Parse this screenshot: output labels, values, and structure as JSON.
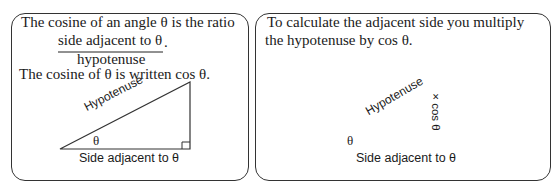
{
  "left_panel": {
    "line1": "The cosine of an angle θ is the ratio",
    "fraction_numerator": "side adjacent to θ",
    "fraction_period": ".",
    "fraction_denominator": "hypotenuse",
    "line2": "The cosine of θ is written cos θ.",
    "diagram": {
      "hypotenuse_label": "Hypotenuse",
      "angle_label": "θ",
      "base_label": "Side adjacent to θ"
    }
  },
  "right_panel": {
    "line1": "To calculate the adjacent side you multiply",
    "line2": "the hypotenuse by cos θ.",
    "diagram": {
      "hypotenuse_label": "Hypotenuse",
      "angle_label": "θ",
      "arrow_label": "× cos θ",
      "base_label": "Side adjacent to θ"
    }
  }
}
